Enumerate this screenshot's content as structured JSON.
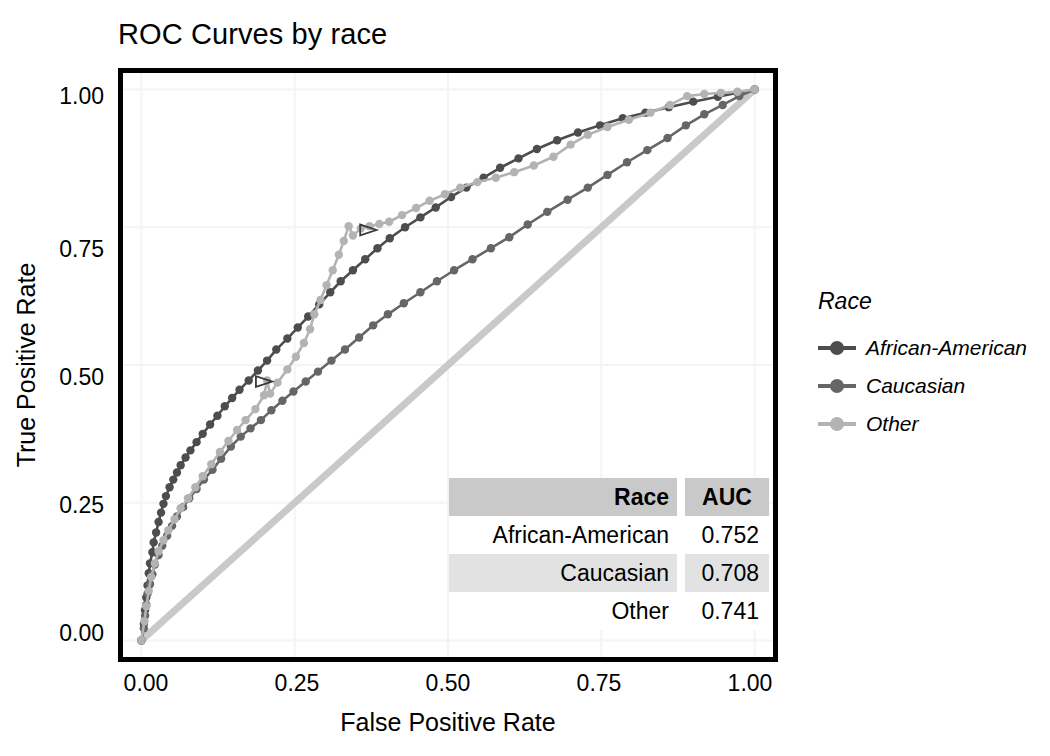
{
  "title": "ROC Curves by race",
  "axes": {
    "x_title": "False Positive Rate",
    "y_title": "True Positive Rate",
    "x_ticks": [
      "0.00",
      "0.25",
      "0.50",
      "0.75",
      "1.00"
    ],
    "y_ticks": [
      "0.00",
      "0.25",
      "0.50",
      "0.75",
      "1.00"
    ]
  },
  "legend": {
    "title": "Race",
    "items": [
      {
        "label": "African-American",
        "color": "#4d4d4d",
        "icon": "line-dot-key-icon"
      },
      {
        "label": "Caucasian",
        "color": "#666666",
        "icon": "line-dot-key-icon"
      },
      {
        "label": "Other",
        "color": "#b3b3b3",
        "icon": "line-dot-key-icon"
      }
    ]
  },
  "auc_table": {
    "headers": [
      "Race",
      "AUC"
    ],
    "rows": [
      {
        "race": "African-American",
        "auc": "0.752"
      },
      {
        "race": "Caucasian",
        "auc": "0.708"
      },
      {
        "race": "Other",
        "auc": "0.741"
      }
    ]
  },
  "colors": {
    "african_american": "#4d4d4d",
    "caucasian": "#666666",
    "other": "#b3b3b3",
    "diagonal": "#c9c9c9",
    "grid": "#f4f4f4",
    "panel_border": "#000000",
    "table_header_bg": "#c9c9c9",
    "table_row_alt_bg": "#e2e2e2"
  },
  "chart_data": {
    "type": "line",
    "title": "ROC Curves by race",
    "xlabel": "False Positive Rate",
    "ylabel": "True Positive Rate",
    "xlim": [
      -0.03,
      1.03
    ],
    "ylim": [
      -0.03,
      1.03
    ],
    "grid": true,
    "legend_position": "right",
    "legend_title": "Race",
    "markers": "circle",
    "reference_line": {
      "label": "chance diagonal",
      "from": [
        0,
        0
      ],
      "to": [
        1,
        1
      ],
      "color": "#c9c9c9"
    },
    "annotations": [
      {
        "text": "",
        "shape": "triangle",
        "x": 0.2,
        "y": 0.47
      },
      {
        "text": "",
        "shape": "triangle",
        "x": 0.37,
        "y": 0.745
      }
    ],
    "auc": {
      "African-American": 0.752,
      "Caucasian": 0.708,
      "Other": 0.741
    },
    "series": [
      {
        "name": "African-American",
        "color": "#4d4d4d",
        "auc": 0.752,
        "points": [
          [
            0.0,
            0.0
          ],
          [
            0.004,
            0.03
          ],
          [
            0.006,
            0.055
          ],
          [
            0.008,
            0.078
          ],
          [
            0.01,
            0.1
          ],
          [
            0.012,
            0.122
          ],
          [
            0.014,
            0.14
          ],
          [
            0.018,
            0.16
          ],
          [
            0.02,
            0.178
          ],
          [
            0.024,
            0.196
          ],
          [
            0.028,
            0.215
          ],
          [
            0.032,
            0.232
          ],
          [
            0.036,
            0.248
          ],
          [
            0.04,
            0.262
          ],
          [
            0.046,
            0.278
          ],
          [
            0.052,
            0.292
          ],
          [
            0.058,
            0.305
          ],
          [
            0.064,
            0.318
          ],
          [
            0.072,
            0.332
          ],
          [
            0.08,
            0.345
          ],
          [
            0.09,
            0.36
          ],
          [
            0.1,
            0.375
          ],
          [
            0.112,
            0.392
          ],
          [
            0.124,
            0.408
          ],
          [
            0.136,
            0.425
          ],
          [
            0.148,
            0.44
          ],
          [
            0.16,
            0.455
          ],
          [
            0.175,
            0.472
          ],
          [
            0.19,
            0.49
          ],
          [
            0.205,
            0.508
          ],
          [
            0.22,
            0.528
          ],
          [
            0.238,
            0.548
          ],
          [
            0.255,
            0.568
          ],
          [
            0.272,
            0.588
          ],
          [
            0.29,
            0.61
          ],
          [
            0.308,
            0.632
          ],
          [
            0.325,
            0.652
          ],
          [
            0.345,
            0.672
          ],
          [
            0.365,
            0.692
          ],
          [
            0.385,
            0.712
          ],
          [
            0.405,
            0.73
          ],
          [
            0.43,
            0.75
          ],
          [
            0.455,
            0.768
          ],
          [
            0.48,
            0.786
          ],
          [
            0.505,
            0.805
          ],
          [
            0.53,
            0.822
          ],
          [
            0.558,
            0.84
          ],
          [
            0.585,
            0.858
          ],
          [
            0.615,
            0.875
          ],
          [
            0.645,
            0.892
          ],
          [
            0.678,
            0.908
          ],
          [
            0.712,
            0.922
          ],
          [
            0.748,
            0.935
          ],
          [
            0.785,
            0.948
          ],
          [
            0.822,
            0.958
          ],
          [
            0.86,
            0.968
          ],
          [
            0.9,
            0.978
          ],
          [
            0.94,
            0.987
          ],
          [
            0.972,
            0.994
          ],
          [
            1.0,
            1.0
          ]
        ]
      },
      {
        "name": "Caucasian",
        "color": "#666666",
        "auc": 0.708,
        "points": [
          [
            0.0,
            0.0
          ],
          [
            0.004,
            0.022
          ],
          [
            0.006,
            0.045
          ],
          [
            0.008,
            0.065
          ],
          [
            0.01,
            0.085
          ],
          [
            0.014,
            0.102
          ],
          [
            0.018,
            0.12
          ],
          [
            0.022,
            0.138
          ],
          [
            0.028,
            0.155
          ],
          [
            0.034,
            0.172
          ],
          [
            0.042,
            0.19
          ],
          [
            0.05,
            0.208
          ],
          [
            0.058,
            0.225
          ],
          [
            0.068,
            0.242
          ],
          [
            0.078,
            0.258
          ],
          [
            0.09,
            0.275
          ],
          [
            0.102,
            0.292
          ],
          [
            0.116,
            0.31
          ],
          [
            0.13,
            0.33
          ],
          [
            0.146,
            0.352
          ],
          [
            0.162,
            0.37
          ],
          [
            0.178,
            0.385
          ],
          [
            0.195,
            0.4
          ],
          [
            0.212,
            0.418
          ],
          [
            0.23,
            0.435
          ],
          [
            0.248,
            0.452
          ],
          [
            0.268,
            0.47
          ],
          [
            0.288,
            0.488
          ],
          [
            0.31,
            0.508
          ],
          [
            0.332,
            0.528
          ],
          [
            0.355,
            0.55
          ],
          [
            0.378,
            0.572
          ],
          [
            0.402,
            0.592
          ],
          [
            0.428,
            0.612
          ],
          [
            0.455,
            0.632
          ],
          [
            0.482,
            0.652
          ],
          [
            0.51,
            0.672
          ],
          [
            0.54,
            0.692
          ],
          [
            0.57,
            0.712
          ],
          [
            0.6,
            0.732
          ],
          [
            0.63,
            0.755
          ],
          [
            0.662,
            0.778
          ],
          [
            0.695,
            0.8
          ],
          [
            0.728,
            0.822
          ],
          [
            0.76,
            0.845
          ],
          [
            0.792,
            0.868
          ],
          [
            0.825,
            0.89
          ],
          [
            0.858,
            0.912
          ],
          [
            0.888,
            0.935
          ],
          [
            0.918,
            0.955
          ],
          [
            0.948,
            0.972
          ],
          [
            0.975,
            0.988
          ],
          [
            1.0,
            1.0
          ]
        ]
      },
      {
        "name": "Other",
        "color": "#b3b3b3",
        "auc": 0.741,
        "points": [
          [
            0.0,
            0.0
          ],
          [
            0.005,
            0.035
          ],
          [
            0.008,
            0.062
          ],
          [
            0.012,
            0.09
          ],
          [
            0.016,
            0.115
          ],
          [
            0.022,
            0.14
          ],
          [
            0.028,
            0.162
          ],
          [
            0.036,
            0.182
          ],
          [
            0.044,
            0.2
          ],
          [
            0.054,
            0.22
          ],
          [
            0.064,
            0.24
          ],
          [
            0.076,
            0.258
          ],
          [
            0.088,
            0.278
          ],
          [
            0.1,
            0.298
          ],
          [
            0.114,
            0.32
          ],
          [
            0.128,
            0.342
          ],
          [
            0.142,
            0.362
          ],
          [
            0.156,
            0.382
          ],
          [
            0.17,
            0.4
          ],
          [
            0.186,
            0.42
          ],
          [
            0.2,
            0.445
          ],
          [
            0.205,
            0.472
          ],
          [
            0.21,
            0.448
          ],
          [
            0.222,
            0.468
          ],
          [
            0.238,
            0.492
          ],
          [
            0.252,
            0.515
          ],
          [
            0.265,
            0.54
          ],
          [
            0.275,
            0.565
          ],
          [
            0.282,
            0.592
          ],
          [
            0.292,
            0.618
          ],
          [
            0.302,
            0.645
          ],
          [
            0.312,
            0.672
          ],
          [
            0.322,
            0.7
          ],
          [
            0.33,
            0.725
          ],
          [
            0.338,
            0.752
          ],
          [
            0.345,
            0.735
          ],
          [
            0.358,
            0.748
          ],
          [
            0.372,
            0.752
          ],
          [
            0.388,
            0.756
          ],
          [
            0.404,
            0.76
          ],
          [
            0.425,
            0.772
          ],
          [
            0.448,
            0.785
          ],
          [
            0.47,
            0.798
          ],
          [
            0.495,
            0.81
          ],
          [
            0.52,
            0.822
          ],
          [
            0.548,
            0.832
          ],
          [
            0.578,
            0.84
          ],
          [
            0.608,
            0.85
          ],
          [
            0.64,
            0.862
          ],
          [
            0.672,
            0.878
          ],
          [
            0.7,
            0.9
          ],
          [
            0.728,
            0.918
          ],
          [
            0.76,
            0.932
          ],
          [
            0.795,
            0.945
          ],
          [
            0.83,
            0.958
          ],
          [
            0.862,
            0.972
          ],
          [
            0.89,
            0.988
          ],
          [
            0.918,
            0.992
          ],
          [
            0.945,
            0.994
          ],
          [
            0.972,
            0.996
          ],
          [
            1.0,
            1.0
          ]
        ]
      }
    ]
  }
}
